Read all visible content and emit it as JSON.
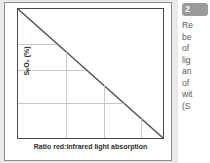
{
  "figure": {
    "card_name": "oximetry-calibration-figure",
    "axes": {
      "y_label": "SₚO₂ (%)",
      "x_label": "Ratio red:infrared light absorption"
    }
  },
  "chart_data": {
    "type": "line",
    "title": "",
    "xlabel": "Ratio red:infrared light absorption",
    "ylabel": "SₚO₂ (%)",
    "x": [
      0,
      1
    ],
    "series": [
      {
        "name": "calibration-curve",
        "values": [
          100,
          0
        ],
        "color": "#555555"
      }
    ],
    "xlim": [
      0,
      1
    ],
    "ylim": [
      0,
      100
    ],
    "grid": true,
    "gridlines_h_frac": [
      0.27,
      0.47,
      0.73
    ],
    "gridlines_v_frac": [
      0.33,
      0.59,
      0.85
    ],
    "legend": "none",
    "tick_labels_x": [],
    "tick_labels_y": [],
    "annotations": []
  },
  "caption": {
    "badge": "2",
    "lines": [
      "Re",
      "be",
      "of ",
      "lig",
      "an",
      "of ",
      "wit",
      "(S"
    ]
  },
  "colors": {
    "page_background": "#e9e9e9",
    "card_background": "#ffffff",
    "axis": "#4a4a4a",
    "gridline": "#c8c8c8",
    "curve": "#555555",
    "badge": "#9a9a9a",
    "caption_text": "#5a5a5a",
    "label_text": "#2c2c2c"
  }
}
